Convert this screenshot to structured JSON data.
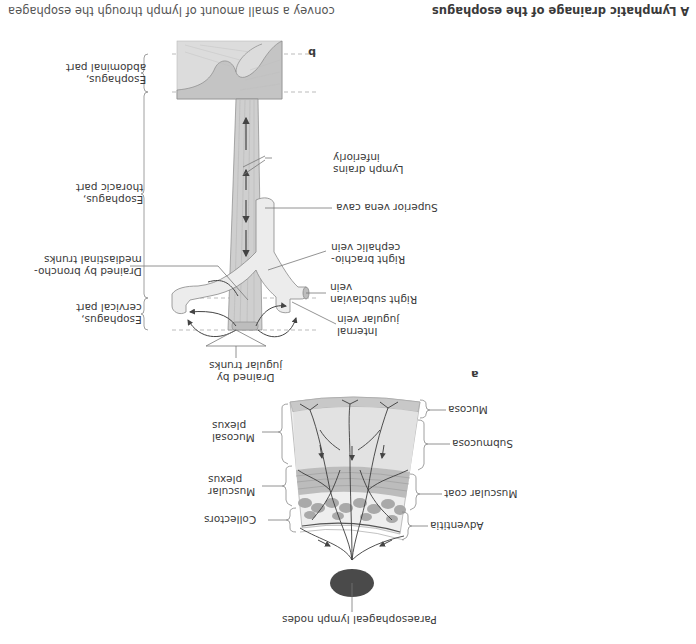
{
  "figure": {
    "title": "A  Lymphatic drainage of the esophagus",
    "caption_fragment": "convey a small amount of lymph through the esophagea",
    "colors": {
      "text": "#3a3a3a",
      "line": "#555555",
      "dashed": "#aaaaaa",
      "esophagus_fill": "#cfcfcf",
      "vein_fill": "#ececec",
      "stomach_fill": "#d4d4d4",
      "mucosa_fill": "#c8c8c8",
      "submucosa_fill": "#e6e6e6",
      "muscle_fill": "#b5b5b5",
      "lymph_node_fill": "#4a4a4a",
      "vessel": "#3c3c3c"
    }
  },
  "panel_a": {
    "letter": "a",
    "layers_right": [
      {
        "label": "Mucosa"
      },
      {
        "label": "Submucosa"
      },
      {
        "label": "Muscular coat"
      },
      {
        "label": "Adventitia"
      }
    ],
    "plexus_left": [
      {
        "label_line1": "Mucosal",
        "label_line2": "plexus"
      },
      {
        "label_line1": "Muscular",
        "label_line2": "plexus"
      },
      {
        "label_line1": "Collectors",
        "label_line2": ""
      }
    ],
    "lymph_node_label": "Paraesophageal lymph nodes"
  },
  "panel_b": {
    "letter": "b",
    "segments": [
      {
        "label_line1": "Esophagus,",
        "label_line2": "abdominal part"
      },
      {
        "label_line1": "Esophagus,",
        "label_line2": "thoracic part"
      },
      {
        "label_line1": "Esophagus,",
        "label_line2": "cervical part"
      }
    ],
    "drained_broncho": {
      "line1": "Drained by broncho-",
      "line2": "mediastinal trunks"
    },
    "drained_jugular": {
      "line1": "Drained by",
      "line2": "jugular trunks"
    },
    "right_labels": [
      {
        "line1": "Lymph drains",
        "line2": "inferiorly"
      },
      {
        "line1": "Superior vena cava",
        "line2": ""
      },
      {
        "line1": "Right brachio-",
        "line2": "cephalic vein"
      },
      {
        "line1": "Right subclavian",
        "line2": "vein"
      },
      {
        "line1": "Internal",
        "line2": "jugular vein"
      }
    ]
  }
}
